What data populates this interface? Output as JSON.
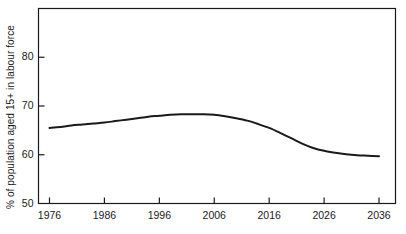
{
  "chart_data": {
    "type": "line",
    "title": "",
    "subtitle": "",
    "xlabel": "",
    "ylabel": "% of population aged 15+ in labour force",
    "xlim": [
      1974,
      2039
    ],
    "ylim": [
      50,
      90
    ],
    "xticks": [
      1976,
      1986,
      1996,
      2006,
      2016,
      2026,
      2036
    ],
    "xtick_labels": [
      "1976",
      "1986",
      "1996",
      "2006",
      "2016",
      "2026",
      "2036"
    ],
    "yticks": [
      50,
      60,
      70,
      80
    ],
    "ytick_labels": [
      "50",
      "60",
      "70",
      "80"
    ],
    "grid": false,
    "legend": null,
    "legend_position": "none",
    "series": [
      {
        "name": "Labour force participation rate",
        "color": "#1a1a1a",
        "line_width": 2.0,
        "x": [
          1976,
          1978,
          1980,
          1982,
          1984,
          1986,
          1988,
          1990,
          1992,
          1994,
          1996,
          1998,
          2000,
          2002,
          2004,
          2006,
          2008,
          2010,
          2012,
          2014,
          2016,
          2018,
          2020,
          2022,
          2024,
          2026,
          2028,
          2030,
          2032,
          2034,
          2036
        ],
        "values": [
          65.5,
          65.7,
          66.0,
          66.2,
          66.4,
          66.6,
          66.9,
          67.2,
          67.5,
          67.8,
          68.0,
          68.2,
          68.3,
          68.3,
          68.3,
          68.2,
          67.9,
          67.5,
          67.0,
          66.3,
          65.5,
          64.5,
          63.4,
          62.3,
          61.4,
          60.8,
          60.4,
          60.1,
          59.9,
          59.8,
          59.7
        ]
      }
    ]
  },
  "axes": {
    "frame_color": "#1a1a1a",
    "tick_color": "#1a1a1a",
    "background": "#ffffff"
  }
}
